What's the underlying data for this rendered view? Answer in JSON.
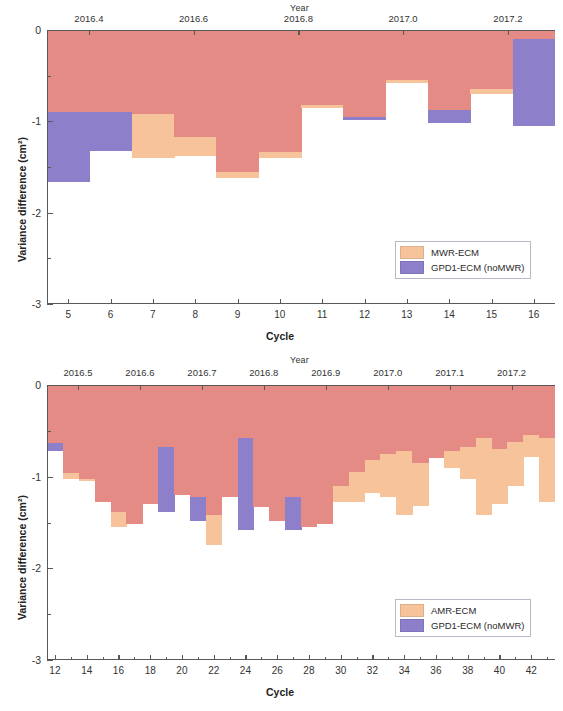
{
  "figure": {
    "y_axis_label": "Variance difference (cm²)",
    "x_axis_label": "Cycle",
    "top_axis_label": "Year",
    "y_ticks": [
      "0",
      "-1",
      "-2",
      "-3"
    ],
    "y_tick_values": [
      0,
      -1,
      -2,
      -3
    ],
    "colors": {
      "orange": "#F7C39A",
      "purple": "#8E7FCB",
      "overlap": "#E58B86",
      "axis": "#585858",
      "text": "#2b2b2b"
    }
  },
  "chart_data": [
    {
      "id": "panel-1",
      "type": "bar",
      "title": "",
      "xlabel": "Cycle",
      "ylabel": "Variance difference (cm²)",
      "ylim": [
        -3,
        0
      ],
      "grid": false,
      "legend_position": "bottom-right",
      "top_axis": {
        "label": "Year",
        "ticks": [
          "2016.4",
          "2016.6",
          "2016.8",
          "2017.0",
          "2017.2"
        ],
        "values": [
          2016.4,
          2016.6,
          2016.8,
          2017.0,
          2017.2
        ],
        "range": [
          2016.32,
          2017.29
        ]
      },
      "x_ticks": [
        "5",
        "6",
        "7",
        "8",
        "9",
        "10",
        "11",
        "12",
        "13",
        "14",
        "15",
        "16"
      ],
      "categories": [
        5,
        6,
        7,
        8,
        9,
        10,
        11,
        12,
        13,
        14,
        15,
        16
      ],
      "xlim": [
        4.5,
        16.5
      ],
      "series": [
        {
          "name": "MWR-ECM",
          "color": "#F7C39A",
          "values": [
            -0.9,
            -0.9,
            -1.4,
            -1.38,
            -1.62,
            -1.4,
            -0.85,
            -0.95,
            -0.58,
            -0.88,
            -0.7,
            -0.1
          ]
        },
        {
          "name": "GPD1-ECM (noMWR)",
          "color": "#8E7FCB",
          "values": [
            -1.66,
            -1.32,
            -0.92,
            -1.17,
            -1.55,
            -1.34,
            -0.82,
            -0.98,
            -0.55,
            -1.02,
            -0.65,
            -1.05
          ]
        }
      ],
      "legend": [
        {
          "label": "MWR-ECM",
          "color": "#F7C39A"
        },
        {
          "label": "GPD1-ECM (noMWR)",
          "color": "#8E7FCB"
        }
      ]
    },
    {
      "id": "panel-2",
      "type": "bar",
      "title": "",
      "xlabel": "Cycle",
      "ylabel": "Variance difference (cm²)",
      "ylim": [
        -3,
        0
      ],
      "grid": false,
      "legend_position": "bottom-right",
      "top_axis": {
        "label": "Year",
        "ticks": [
          "2016.5",
          "2016.6",
          "2016.7",
          "2016.8",
          "2016.9",
          "2017.0",
          "2017.1",
          "2017.2"
        ],
        "values": [
          2016.5,
          2016.6,
          2016.7,
          2016.8,
          2016.9,
          2017.0,
          2017.1,
          2017.2
        ],
        "range": [
          2016.45,
          2017.27
        ]
      },
      "x_ticks": [
        "12",
        "14",
        "16",
        "18",
        "20",
        "22",
        "24",
        "26",
        "28",
        "30",
        "32",
        "34",
        "36",
        "38",
        "40",
        "42"
      ],
      "categories": [
        12,
        13,
        14,
        15,
        16,
        17,
        18,
        19,
        20,
        21,
        22,
        23,
        24,
        25,
        26,
        27,
        28,
        29,
        30,
        31,
        32,
        33,
        34,
        35,
        36,
        37,
        38,
        39,
        40,
        41,
        42,
        43
      ],
      "xlim": [
        11.5,
        43.5
      ],
      "series": [
        {
          "name": "AMR-ECM",
          "color": "#F7C39A",
          "values": [
            -0.63,
            -1.02,
            -1.05,
            -1.28,
            -1.55,
            -1.52,
            -1.3,
            -0.68,
            -1.2,
            -1.22,
            -1.75,
            -1.22,
            -0.58,
            -1.33,
            -1.48,
            -1.22,
            -1.55,
            -1.52,
            -1.28,
            -1.28,
            -1.18,
            -1.22,
            -1.42,
            -1.32,
            -0.8,
            -0.9,
            -1.02,
            -1.42,
            -1.3,
            -1.1,
            -0.78,
            -1.28
          ]
        },
        {
          "name": "GPD1-ECM (noMWR)",
          "color": "#8E7FCB",
          "values": [
            -0.72,
            -0.96,
            -1.02,
            -1.28,
            -1.38,
            -1.52,
            -1.3,
            -1.38,
            -1.2,
            -1.48,
            -1.42,
            -1.22,
            -1.58,
            -1.33,
            -1.48,
            -1.58,
            -1.55,
            -1.52,
            -1.1,
            -0.95,
            -0.82,
            -0.75,
            -0.72,
            -0.85,
            -0.8,
            -0.72,
            -0.68,
            -0.58,
            -0.7,
            -0.62,
            -0.55,
            -0.58
          ]
        }
      ],
      "legend": [
        {
          "label": "AMR-ECM",
          "color": "#F7C39A"
        },
        {
          "label": "GPD1-ECM (noMWR)",
          "color": "#8E7FCB"
        }
      ]
    }
  ]
}
